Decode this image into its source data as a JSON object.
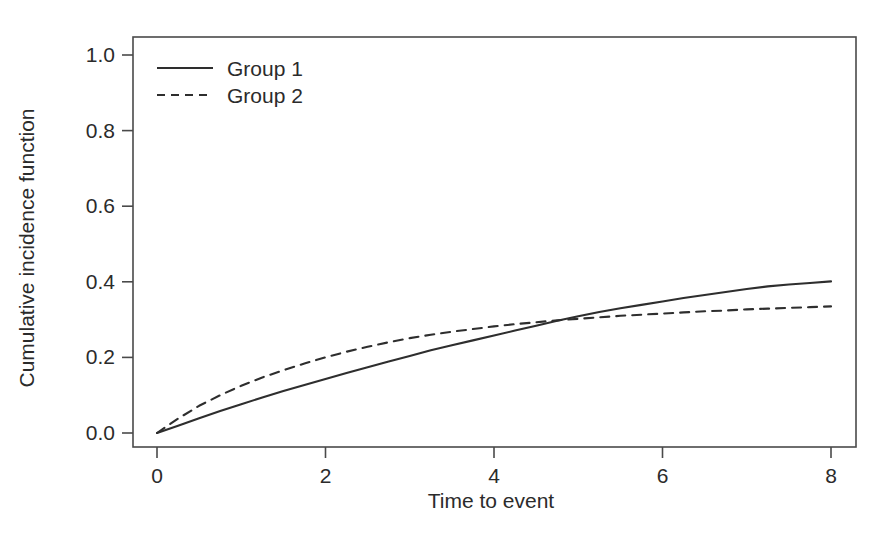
{
  "figure": {
    "background_color": "#ffffff",
    "line_color": "#2e2e2e",
    "axis_color": "#4a4a4a",
    "width_px": 894,
    "height_px": 534
  },
  "chart_data": {
    "type": "line",
    "title": "",
    "subtitle": "",
    "xlabel": "Time to event",
    "ylabel": "Cumulative incidence function",
    "xlim": [
      0,
      8
    ],
    "ylim": [
      0.0,
      1.0
    ],
    "xticks": [
      0,
      2,
      4,
      6,
      8
    ],
    "xticklabels": [
      "0",
      "2",
      "4",
      "6",
      "8"
    ],
    "yticks": [
      0.0,
      0.2,
      0.4,
      0.6,
      0.8,
      1.0
    ],
    "yticklabels": [
      "0.0",
      "0.2",
      "0.4",
      "0.6",
      "0.8",
      "1.0"
    ],
    "grid": false,
    "frame": "box",
    "legend": {
      "position": "top-left",
      "entries": [
        {
          "label": "Group 1",
          "style": "solid"
        },
        {
          "label": "Group 2",
          "style": "dashed"
        }
      ]
    },
    "annotations": [],
    "series": [
      {
        "name": "Group 1",
        "style": "solid",
        "dash": "none",
        "color": "#2e2e2e",
        "x": [
          0.0,
          0.25,
          0.5,
          0.75,
          1.0,
          1.25,
          1.5,
          1.75,
          2.0,
          2.25,
          2.5,
          2.75,
          3.0,
          3.25,
          3.5,
          3.75,
          4.0,
          4.25,
          4.5,
          4.75,
          5.0,
          5.25,
          5.5,
          5.75,
          6.0,
          6.25,
          6.5,
          6.75,
          7.0,
          7.25,
          7.5,
          7.75,
          8.0
        ],
        "y": [
          0.0,
          0.019,
          0.039,
          0.058,
          0.076,
          0.094,
          0.111,
          0.127,
          0.143,
          0.159,
          0.174,
          0.189,
          0.204,
          0.219,
          0.232,
          0.245,
          0.258,
          0.271,
          0.284,
          0.297,
          0.309,
          0.32,
          0.33,
          0.339,
          0.348,
          0.357,
          0.365,
          0.373,
          0.381,
          0.388,
          0.393,
          0.397,
          0.401
        ]
      },
      {
        "name": "Group 2",
        "style": "dashed",
        "dash": "9 7",
        "color": "#2e2e2e",
        "x": [
          0.0,
          0.25,
          0.5,
          0.75,
          1.0,
          1.25,
          1.5,
          1.75,
          2.0,
          2.25,
          2.5,
          2.75,
          3.0,
          3.25,
          3.5,
          3.75,
          4.0,
          4.25,
          4.5,
          4.75,
          5.0,
          5.25,
          5.5,
          5.75,
          6.0,
          6.25,
          6.5,
          6.75,
          7.0,
          7.25,
          7.5,
          7.75,
          8.0
        ],
        "y": [
          0.0,
          0.038,
          0.072,
          0.1,
          0.125,
          0.147,
          0.166,
          0.184,
          0.2,
          0.215,
          0.228,
          0.24,
          0.251,
          0.26,
          0.268,
          0.275,
          0.282,
          0.288,
          0.293,
          0.298,
          0.302,
          0.306,
          0.31,
          0.313,
          0.316,
          0.319,
          0.322,
          0.324,
          0.327,
          0.329,
          0.331,
          0.333,
          0.335
        ]
      }
    ]
  },
  "layout": {
    "plot_left_px": 133,
    "plot_right_px": 856,
    "plot_top_px": 37,
    "plot_bottom_px": 447,
    "x0_px": 157,
    "x8_px": 831,
    "y0_px": 433,
    "y1_px": 55,
    "legend_x_px": 157,
    "legend_line_end_px": 213,
    "legend_text_x_px": 227,
    "legend_row1_y_px": 68,
    "legend_row2_y_px": 95,
    "xlabel_x_px": 491,
    "xlabel_y_px": 508,
    "ylabel_x_px": 34,
    "ylabel_y_px": 248
  }
}
